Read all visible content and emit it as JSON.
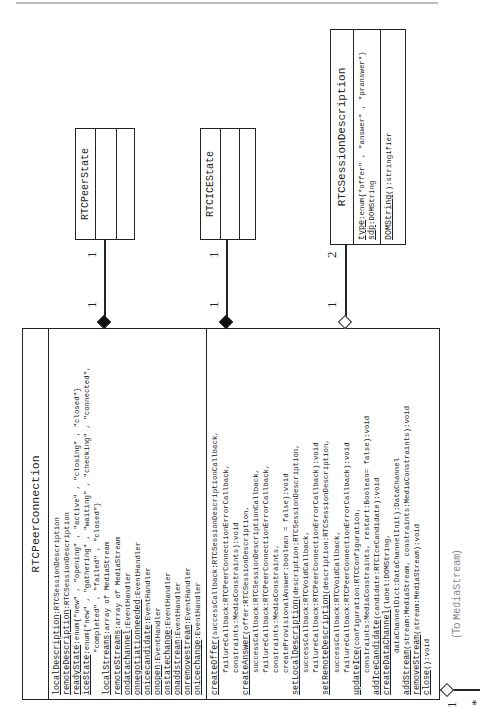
{
  "diagram": {
    "type": "UML class diagram",
    "orientation": "rotated -90deg",
    "classes": {
      "peer_connection": {
        "name": "RTCPeerConnection",
        "attributes": [
          {
            "name": "localDescription",
            "type": ":RTCSessionDescription"
          },
          {
            "name": "remoteDescription",
            "type": ":RTCSessionDescription"
          },
          {
            "name": "readyState",
            "type": ":enum{\"new\" , \"opening\" , \"active\" , \"closing\" , \"closed\"}"
          },
          {
            "name": "iceState",
            "type": ":enum{\"new\" , \"gathering\" , \"waiting\" , \"checking\" , \"connected\","
          },
          {
            "name": "",
            "type": "\"completed\" , \"failed\" , \"closed\"}",
            "indent": 2
          },
          {
            "name": "localStreams",
            "type": ":array of MediaStream"
          },
          {
            "name": "remoteStreams",
            "type": ":array of MediaStream"
          },
          {
            "name": "ondatachannel",
            "type": ":EventHandler"
          },
          {
            "name": "onnegotiationneeded",
            "type": ":EventHandler"
          },
          {
            "name": "onicecandidate",
            "type": ":EventHandler"
          },
          {
            "name": "onopen",
            "type": ":EventHandler"
          },
          {
            "name": "onstatechange",
            "type": ":EventHandler"
          },
          {
            "name": "onaddstream",
            "type": ":EventHandler"
          },
          {
            "name": "onremovestream",
            "type": ":EventHandler"
          },
          {
            "name": "onicechange",
            "type": ":EventHandler"
          }
        ],
        "methods": [
          {
            "name": "createOffer",
            "type": "(successCallback:RTCSessionDescriptionCallback,"
          },
          {
            "name": "",
            "type": "failureCallback:RTCPeerConnectionErrorCallback,",
            "indent": 1
          },
          {
            "name": "",
            "type": "constraints:MediaConstraints):void",
            "indent": 1
          },
          {
            "name": "createAnswer",
            "type": "(offer:RTCSessionDescription,"
          },
          {
            "name": "",
            "type": "successCallback:RTCSessionDescriptionCallback,",
            "indent": 1
          },
          {
            "name": "",
            "type": "failureCallback:RTCPeerConnectionErrorCallback,",
            "indent": 1
          },
          {
            "name": "",
            "type": "constraints:MediaConstraints,",
            "indent": 1
          },
          {
            "name": "",
            "type": "createProvisionalAnswer:boolean = false):void",
            "indent": 1
          },
          {
            "name": "setLocalDescription",
            "type": "(description:RTCSessionDescription,"
          },
          {
            "name": "",
            "type": "successCallback:RTCVoidCallback,",
            "indent": 1
          },
          {
            "name": "",
            "type": "failureCallback:RTCPeerConnectionErrorCallback):void",
            "indent": 1
          },
          {
            "name": "setRemoteDescription",
            "type": "(description:RTCSessionDescription,"
          },
          {
            "name": "",
            "type": "successCallback:RTCVoidCallback,",
            "indent": 1
          },
          {
            "name": "",
            "type": "failureCallback:RTCPeerConnectionErrorCallback):void",
            "indent": 1
          },
          {
            "name": "updateIce",
            "type": "(configuration:RTCConfiguration,"
          },
          {
            "name": "",
            "type": "constraints:MediaConstraints, restart:Boolean= false):void",
            "indent": 1
          },
          {
            "name": "addIceCandidate",
            "type": "(candidate:RTCIceCandidate):void"
          },
          {
            "name": "createDataChannel",
            "type": "(label:DOMString,"
          },
          {
            "name": "",
            "type": "dataChannelDict:DataChannelInit):DataChannel",
            "indent": 2
          },
          {
            "name": "addStream",
            "type": "(stream:MediaStream, constraints:MediaConstraints):void"
          },
          {
            "name": "removeStream",
            "type": "(stream:MediaStream):void"
          },
          {
            "name": "close",
            "type": "():void"
          }
        ]
      },
      "peer_state": {
        "name": "RTCPeerState"
      },
      "ice_state": {
        "name": "RTCICEState"
      },
      "session_description": {
        "name": "RTCSessionDescription",
        "attributes": [
          {
            "name": "type",
            "type": ":enum{\"offer\" , \"answer\" , \"pranswer\"}"
          },
          {
            "name": "sdp",
            "type": ":DOMString"
          }
        ],
        "methods": [
          {
            "name": "DOMString",
            "type": "():stringifier"
          }
        ]
      }
    },
    "associations": {
      "peer_state": {
        "source_mult": "1",
        "target_mult": "1",
        "kind": "composition"
      },
      "ice_state": {
        "source_mult": "1",
        "target_mult": "1",
        "kind": "composition"
      },
      "session_description": {
        "source_mult": "1",
        "target_mult": "2",
        "kind": "aggregation"
      },
      "media_stream": {
        "source_mult": "1",
        "target_mult": "*",
        "kind": "aggregation",
        "label_prefix": "(To ",
        "label_target": "MediaStream",
        "label_suffix": ")"
      }
    }
  }
}
